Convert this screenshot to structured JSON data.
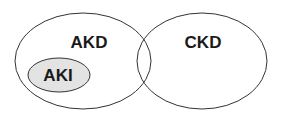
{
  "diagram": {
    "type": "venn",
    "sets": [
      {
        "id": "akd",
        "label": "AKD",
        "fill": "#ffffff",
        "stroke": "#333333"
      },
      {
        "id": "ckd",
        "label": "CKD",
        "fill": "#ffffff",
        "stroke": "#333333"
      },
      {
        "id": "aki",
        "label": "AKI",
        "fill": "#e3e3e3",
        "stroke": "#333333",
        "subset_of": "akd"
      }
    ]
  }
}
